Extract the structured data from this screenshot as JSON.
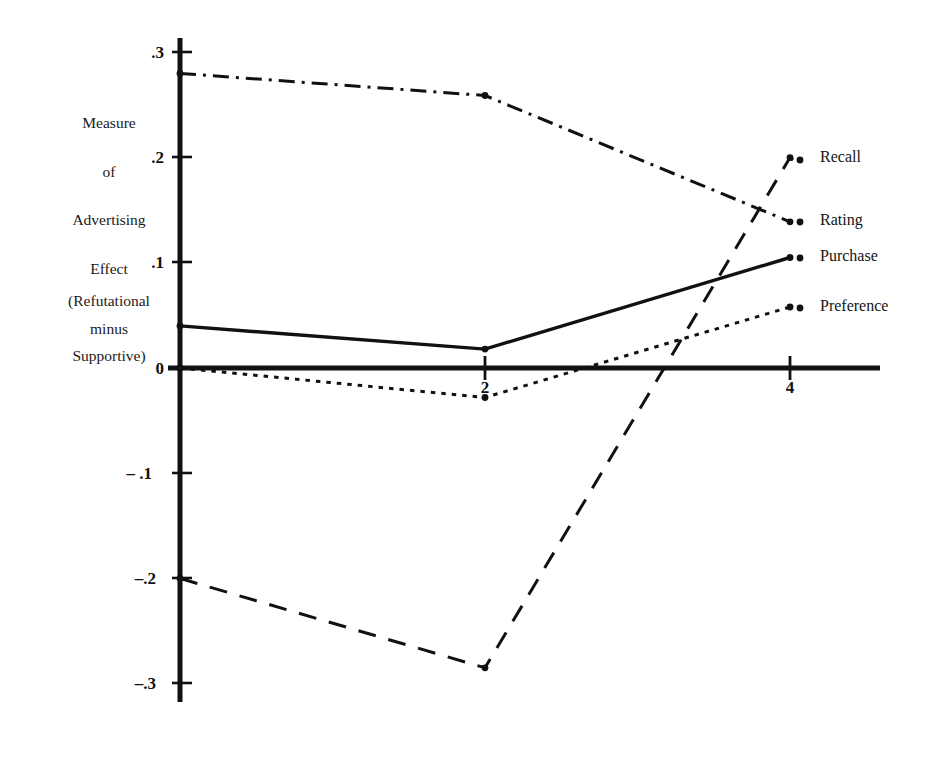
{
  "chart_data": {
    "type": "line",
    "title": "",
    "subtitle": "",
    "xlabel": "",
    "ylabel": "Measure of Advertising Effect (Refutational minus Supportive)",
    "x": [
      0,
      2,
      4
    ],
    "xlim": [
      0,
      4.6
    ],
    "ylim": [
      -0.32,
      0.32
    ],
    "grid": false,
    "legend_position": "right",
    "xticks": [
      "2",
      "4"
    ],
    "xtick_values": [
      2,
      4
    ],
    "yticks": [
      ".3",
      ".2",
      ".1",
      "0",
      "– .1",
      "–.2",
      "–.3"
    ],
    "ytick_values": [
      0.3,
      0.2,
      0.1,
      0.0,
      -0.1,
      -0.2,
      -0.3
    ],
    "series": [
      {
        "name": "Recall",
        "style": "long-dash",
        "values": [
          -0.2,
          -0.285,
          0.2
        ],
        "markers": true
      },
      {
        "name": "Rating",
        "style": "dash-dot",
        "values": [
          0.28,
          0.259,
          0.139
        ],
        "markers": true
      },
      {
        "name": "Purchase",
        "style": "solid",
        "values": [
          0.04,
          0.018,
          0.105
        ],
        "markers": true
      },
      {
        "name": "Preference",
        "style": "dotted",
        "values": [
          0.0,
          -0.028,
          0.058
        ],
        "markers": true
      }
    ]
  },
  "axis_caption": {
    "lines": [
      "Measure",
      "of",
      "Advertising",
      "Effect"
    ],
    "paren_lines": [
      "(Refutational",
      "minus",
      "Supportive)"
    ]
  },
  "legend": {
    "items": [
      {
        "label": "Recall"
      },
      {
        "label": "Rating"
      },
      {
        "label": "Purchase"
      },
      {
        "label": "Preference"
      }
    ]
  },
  "colors": {
    "ink": "#111111",
    "background": "#ffffff"
  }
}
